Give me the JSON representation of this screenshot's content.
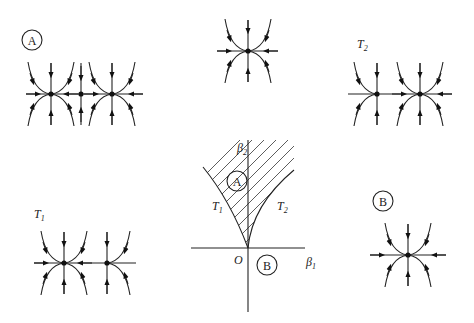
{
  "diagram": {
    "type": "bifurcation-diagram",
    "parameter_plane": {
      "x_axis_label": "β",
      "x_axis_sub": "1",
      "y_axis_label": "β",
      "y_axis_sub": "2",
      "origin_label": "O",
      "curves": [
        {
          "label": "T",
          "sub": "1"
        },
        {
          "label": "T",
          "sub": "2"
        }
      ],
      "regions": [
        {
          "label": "A",
          "hatched": true
        },
        {
          "label": "B",
          "hatched": false
        }
      ]
    },
    "phase_portraits": [
      {
        "position": "top-left",
        "label": "A",
        "label_style": "circled",
        "equilibria": [
          "stable-node",
          "saddle",
          "stable-node"
        ]
      },
      {
        "position": "top-center",
        "label": "",
        "equilibria": [
          "saddle-node (codim-2 point)"
        ]
      },
      {
        "position": "top-right",
        "label": "T",
        "sub": "2",
        "label_style": "italic",
        "equilibria": [
          "saddle-node",
          "stable-node"
        ]
      },
      {
        "position": "bottom-left",
        "label": "T",
        "sub": "1",
        "label_style": "italic",
        "equilibria": [
          "stable-node",
          "saddle-node"
        ]
      },
      {
        "position": "bottom-right",
        "label": "B",
        "label_style": "circled",
        "equilibria": [
          "stable-node"
        ]
      }
    ]
  }
}
